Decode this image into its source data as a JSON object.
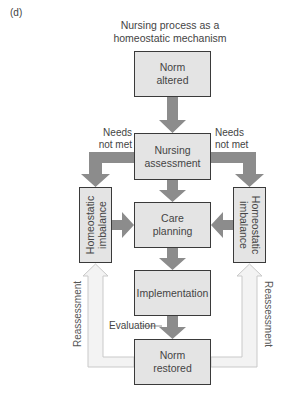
{
  "panel_label": "(d)",
  "title": {
    "line1": "Nursing process as a",
    "line2": "homeostatic mechanism"
  },
  "nodes": {
    "norm_altered": {
      "line1": "Norm",
      "line2": "altered"
    },
    "nursing_assessment": {
      "line1": "Nursing",
      "line2": "assessment"
    },
    "care_planning": {
      "line1": "Care",
      "line2": "planning"
    },
    "implementation": {
      "line1": "Implementation"
    },
    "norm_restored": {
      "line1": "Norm",
      "line2": "restored"
    },
    "homeostatic_left": {
      "line1": "Homeostatic",
      "line2": "imbalance"
    },
    "homeostatic_right": {
      "line1": "Homeostatic",
      "line2": "imbalance"
    }
  },
  "edge_labels": {
    "needs_left": {
      "line1": "Needs",
      "line2": "not met"
    },
    "needs_right": {
      "line1": "Needs",
      "line2": "not met"
    },
    "evaluation": "Evaluation",
    "reassessment_left": "Reassessment",
    "reassessment_right": "Reassessment"
  },
  "colors": {
    "box_fill": "#e4e4e4",
    "box_border": "#3a3a3a",
    "arrow": "#8c8c8c",
    "feedback_arrow_fill": "#f2f2f2",
    "feedback_arrow_border": "#c8c8c8"
  }
}
